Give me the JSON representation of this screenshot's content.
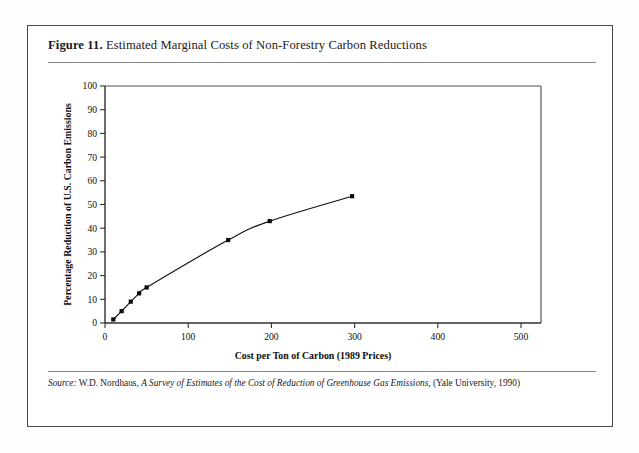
{
  "figure": {
    "number_label": "Figure 11.",
    "caption": "Estimated Marginal Costs of Non-Forestry Carbon Reductions",
    "source_prefix": "Source:",
    "source_author": "W.D. Nordhaus,",
    "source_title": "A Survey of Estimates of the Cost of Reduction of Greenhouse Gas Emissions,",
    "source_publisher": "(Yale University, 1990)"
  },
  "colors": {
    "ink": "#111111",
    "frame": "#4a4a4a",
    "rule": "#8a8a8a",
    "marker": "#0a0a0a",
    "background": "#ffffff"
  },
  "chart_data": {
    "type": "line",
    "title": "Estimated Marginal Costs of Non-Forestry Carbon Reductions",
    "xlabel": "Cost per Ton of Carbon (1989 Prices)",
    "ylabel": "Percentage Reduction of U.S. Carbon Emissions",
    "xlim": [
      0,
      500
    ],
    "ylim": [
      0,
      100
    ],
    "xticks": [
      0,
      100,
      200,
      300,
      400,
      500
    ],
    "yticks": [
      0,
      10,
      20,
      30,
      40,
      50,
      60,
      70,
      80,
      90,
      100
    ],
    "xtick_labels": [
      "0",
      "100",
      "200",
      "300",
      "400",
      "500"
    ],
    "ytick_labels": [
      "0",
      "10",
      "20",
      "30",
      "40",
      "50",
      "60",
      "70",
      "80",
      "90",
      "100"
    ],
    "grid": false,
    "legend": null,
    "marker": "square",
    "series": [
      {
        "name": "Marginal cost of carbon reduction",
        "x": [
          10,
          20,
          31,
          41,
          50,
          148,
          198,
          297
        ],
        "y": [
          1.5,
          5.0,
          9.0,
          12.5,
          15.0,
          35.0,
          43.0,
          53.5
        ]
      }
    ]
  }
}
